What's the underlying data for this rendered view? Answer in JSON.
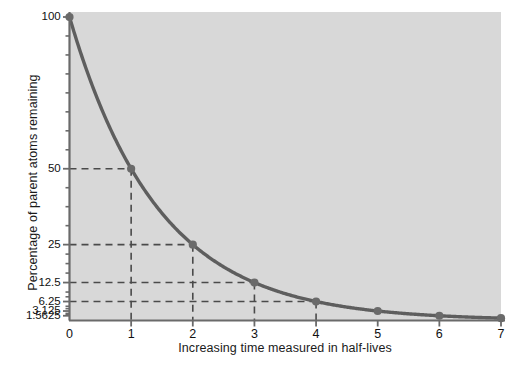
{
  "chart_data": {
    "type": "line",
    "title": "",
    "subtitle": "",
    "xlabel": "Increasing time measured in half-lives",
    "ylabel": "Percentage of parent atoms remaining",
    "x": [
      0,
      1,
      2,
      3,
      4,
      5,
      6,
      7
    ],
    "values": [
      100,
      50,
      25,
      12.5,
      6.25,
      3.125,
      1.5625,
      0.78125
    ],
    "series": [
      {
        "name": "Percentage of parent atoms remaining",
        "values": [
          100,
          50,
          25,
          12.5,
          6.25,
          3.125,
          1.5625,
          0.78125
        ]
      }
    ],
    "xtick_labels": [
      "0",
      "1",
      "2",
      "3",
      "4",
      "5",
      "6",
      "7"
    ],
    "xtick_values": [
      0,
      1,
      2,
      3,
      4,
      5,
      6,
      7
    ],
    "ytick_labels": [
      "100",
      "50",
      "25",
      "12.5",
      "6.25",
      "3.125",
      "1.5625"
    ],
    "ytick_values": [
      100,
      50,
      25,
      12.5,
      6.25,
      3.125,
      1.5625
    ],
    "yminor_tick_values": [
      93.75,
      87.5,
      81.25,
      75,
      68.75,
      62.5,
      56.25,
      43.75,
      37.5,
      31.25,
      21.875,
      18.75,
      15.625,
      9.375,
      7.8125,
      4.6875,
      3.90625,
      2.34375,
      1.953125
    ],
    "xlim": [
      0,
      7
    ],
    "ylim": [
      0,
      100
    ],
    "grid": false,
    "legend": false,
    "legend_position": "none",
    "guide_lines": [
      {
        "x": 1,
        "y": 50,
        "label": "50"
      },
      {
        "x": 2,
        "y": 25,
        "label": "25"
      },
      {
        "x": 3,
        "y": 12.5,
        "label": "12.5"
      },
      {
        "x": 4,
        "y": 6.25,
        "label": "6.25"
      }
    ],
    "annotations": [],
    "colors": {
      "plot_background": "#d8d8d8",
      "page_background": "#ffffff",
      "curve": "#5e5e5e",
      "marker": "#6a6a6a",
      "axis": "#6a6a6a",
      "guide_line": "#4a4a4a",
      "tick_label": "#111111",
      "axis_label": "#1a1a1a"
    }
  }
}
